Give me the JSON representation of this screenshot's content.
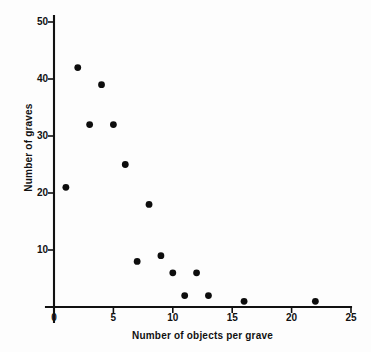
{
  "chart_data": {
    "type": "scatter",
    "title": "",
    "subtitle": "",
    "xlabel": "Number of objects per grave",
    "ylabel": "Number of graves",
    "xlim": [
      0,
      25
    ],
    "ylim": [
      0,
      52
    ],
    "xticks": [
      0,
      5,
      10,
      15,
      20,
      25
    ],
    "xtick_labels": [
      "0",
      "5",
      "10",
      "15",
      "20",
      "25"
    ],
    "yticks": [
      10,
      20,
      30,
      40,
      50
    ],
    "ytick_labels": [
      "10",
      "20",
      "30",
      "40",
      "50"
    ],
    "grid": false,
    "legend": null,
    "marker": "filled-circle",
    "marker_color": "#0d0d0d",
    "series": [
      {
        "name": "graves",
        "points": [
          {
            "x": 1,
            "y": 21
          },
          {
            "x": 2,
            "y": 42
          },
          {
            "x": 3,
            "y": 32
          },
          {
            "x": 4,
            "y": 39
          },
          {
            "x": 5,
            "y": 32
          },
          {
            "x": 6,
            "y": 25
          },
          {
            "x": 7,
            "y": 8
          },
          {
            "x": 8,
            "y": 18
          },
          {
            "x": 9,
            "y": 9
          },
          {
            "x": 10,
            "y": 6
          },
          {
            "x": 11,
            "y": 2
          },
          {
            "x": 12,
            "y": 6
          },
          {
            "x": 13,
            "y": 2
          },
          {
            "x": 16,
            "y": 1
          },
          {
            "x": 22,
            "y": 1
          }
        ]
      }
    ]
  },
  "axes": {
    "x_label": "Number of objects per grave",
    "y_label": "Number of graves"
  },
  "colors": {
    "background": "#fdfdfd",
    "ink": "#111111",
    "marker": "#0d0d0d"
  }
}
